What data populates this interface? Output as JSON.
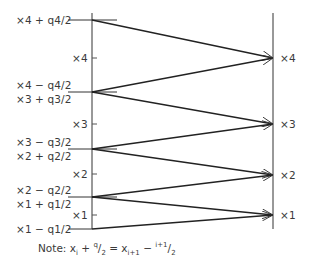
{
  "diagram": {
    "type": "quantizer-mapping",
    "left_axis": {
      "x": 92,
      "y_top": 13,
      "y_bottom": 229,
      "boundaries": [
        {
          "y": 20,
          "labels": [
            "×4 + q4/2"
          ]
        },
        {
          "y": 92,
          "labels": [
            "×4 − q4/2",
            "×3 + q3/2"
          ]
        },
        {
          "y": 149,
          "labels": [
            "×3 − q3/2",
            "×2 + q2/2"
          ]
        },
        {
          "y": 197,
          "labels": [
            "×2 − q2/2",
            "×1 + q1/2"
          ]
        },
        {
          "y": 229,
          "labels": [
            "×1 − q1/2"
          ]
        }
      ],
      "level_ticks": [
        {
          "y": 58,
          "label": "×4"
        },
        {
          "y": 124,
          "label": "×3"
        },
        {
          "y": 174,
          "label": "×2"
        },
        {
          "y": 215,
          "label": "×1"
        }
      ]
    },
    "right_axis": {
      "x": 273,
      "y_top": 13,
      "y_bottom": 229,
      "levels": [
        {
          "y": 58,
          "label": "×4"
        },
        {
          "y": 124,
          "label": "×3"
        },
        {
          "y": 175,
          "label": "×2"
        },
        {
          "y": 215,
          "label": "×1"
        }
      ]
    },
    "arrows": [
      {
        "from_y": 20,
        "to_y": 58
      },
      {
        "from_y": 92,
        "to_y": 58
      },
      {
        "from_y": 92,
        "to_y": 124
      },
      {
        "from_y": 149,
        "to_y": 124
      },
      {
        "from_y": 149,
        "to_y": 175
      },
      {
        "from_y": 197,
        "to_y": 175
      },
      {
        "from_y": 197,
        "to_y": 215
      },
      {
        "from_y": 229,
        "to_y": 215
      }
    ],
    "labels": {
      "b4_top": "×4 + q4/2",
      "b3_a": "×4 − q4/2",
      "b3_b": "×3 + q3/2",
      "b2_a": "×3 − q3/2",
      "b2_b": "×2 + q2/2",
      "b1_a": "×2 − q2/2",
      "b1_b": "×1 + q1/2",
      "b0": "×1 − q1/2",
      "mid_x4": "×4",
      "mid_x3": "×3",
      "mid_x2": "×2",
      "mid_x1": "×1",
      "right_x4": "×4",
      "right_x3": "×3",
      "right_x2": "×2",
      "right_x1": "×1"
    },
    "note": {
      "prefix": "Note: ",
      "x1": "x",
      "x1_sub": "i",
      "plus": " + ",
      "q1": "q",
      "q1_sub": "i",
      "slash1": "/",
      "two1": "2",
      "eq": " = ",
      "x2": "x",
      "x2_sub": "i+1",
      "minus": " − ",
      "q2": "q",
      "q2_sub": "i+1",
      "slash2": "/",
      "two2": "2"
    }
  }
}
